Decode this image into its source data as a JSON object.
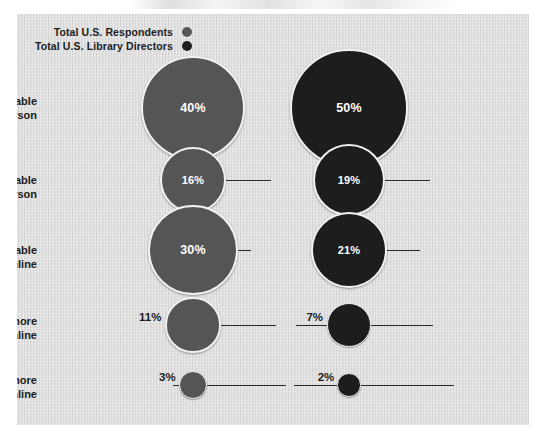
{
  "chart_data": {
    "type": "bubble",
    "title": "",
    "xlabel": "",
    "ylabel": "",
    "categories": [
      "Much more comfortable in person",
      "Somewhat more comfortable in person",
      "Just as comfortable in person as online",
      "Somewhat more comfortable online",
      "Much more comfortable online"
    ],
    "series": [
      {
        "name": "Total U.S. Respondents",
        "color": "#555555",
        "values": [
          40,
          30,
          16,
          11,
          3
        ],
        "values_in_row_order": [
          40,
          16,
          30,
          11,
          3
        ],
        "labels": [
          "40%",
          "16%",
          "30%",
          "11%",
          "3%"
        ]
      },
      {
        "name": "Total U.S. Library Directors",
        "color": "#1d1d1d",
        "values": [
          50,
          21,
          19,
          7,
          2
        ],
        "values_in_row_order": [
          50,
          19,
          21,
          7,
          2
        ],
        "labels": [
          "50%",
          "19%",
          "21%",
          "7%",
          "2%"
        ]
      }
    ],
    "unit": "percent",
    "grid": false,
    "legend_position": "top-left"
  },
  "legend": {
    "items": [
      {
        "label": "Total U.S. Respondents",
        "color": "#555555"
      },
      {
        "label": "Total U.S. Library Directors",
        "color": "#1d1d1d"
      }
    ]
  },
  "rows": [
    {
      "label_line1": "Much more comfortable",
      "label_line2": "in person",
      "respondents": "40%",
      "directors": "50%"
    },
    {
      "label_line1": "Somewhat more comfortable",
      "label_line2": "in person",
      "respondents": "16%",
      "directors": "19%"
    },
    {
      "label_line1": "Just as comfortable",
      "label_line2": "in person as online",
      "respondents": "30%",
      "directors": "21%"
    },
    {
      "label_line1": "Somewhat more",
      "label_line2": "comfortable online",
      "respondents": "11%",
      "directors": "7%"
    },
    {
      "label_line1": "Much more",
      "label_line2": "comfortable online",
      "respondents": "3%",
      "directors": "2%"
    }
  ],
  "colors": {
    "panel_background": "#dcdcdc",
    "page_background": "#ffffff",
    "respondents": "#555555",
    "directors": "#1d1d1d",
    "connector": "#2a2a2a",
    "bubble_ring": "#f2f2f2",
    "text": "#1c1c1c",
    "value_text_inside": "#ffffff"
  }
}
